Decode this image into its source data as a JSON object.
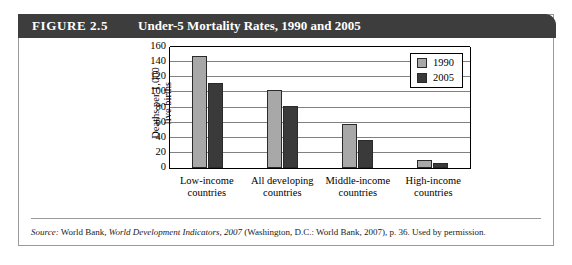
{
  "figure": {
    "number_label": "FIGURE 2.5",
    "title": "Under-5 Mortality Rates, 1990 and 2005"
  },
  "source": {
    "prefix_label": "Source:",
    "publisher": "World Bank,",
    "work_title": "World Development Indicators, 2007",
    "publication_detail": "(Washington, D.C.: World Bank, 2007), p. 36. Used by permission."
  },
  "colors": {
    "header_bg": "#3d3d3d",
    "series_1990": "#a8a8a8",
    "series_2005": "#3a3a3a",
    "gridline": "#808080",
    "frame_border": "#9a9a9a"
  },
  "chart_data": {
    "type": "bar",
    "title": "Under-5 Mortality Rates, 1990 and 2005",
    "xlabel": "",
    "ylabel": "Deaths per 1,000\nlive births",
    "categories": [
      "Low-income\ncountries",
      "All developing\ncountries",
      "Middle-income\ncountries",
      "High-income\ncountries"
    ],
    "series": [
      {
        "name": "1990",
        "values": [
          148,
          103,
          58,
          11
        ]
      },
      {
        "name": "2005",
        "values": [
          113,
          82,
          37,
          6
        ]
      }
    ],
    "ylim": [
      0,
      160
    ],
    "yticks": [
      0,
      20,
      40,
      60,
      80,
      100,
      120,
      140,
      160
    ],
    "ytick_labels": [
      "0",
      "20",
      "40",
      "60",
      "80",
      "100",
      "120",
      "140",
      "160"
    ],
    "grid": true,
    "legend_position": "top-right",
    "legend_entries": [
      "1990",
      "2005"
    ]
  }
}
